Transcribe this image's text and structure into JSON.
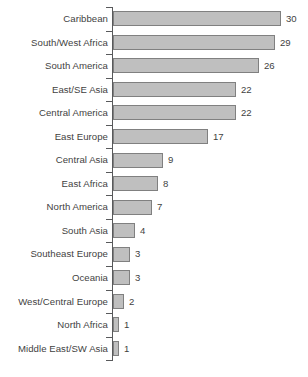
{
  "chart_data": {
    "type": "bar",
    "orientation": "horizontal",
    "title": "",
    "subtitle": "",
    "xlabel": "",
    "ylabel": "",
    "xlim": [
      0,
      30
    ],
    "grid": false,
    "legend": null,
    "bar_color": "#bfbfbf",
    "bar_border_color": "#808080",
    "axis_color": "#58595b",
    "text_color": "#3f3f3f",
    "background_color": "#ffffff",
    "show_value_labels": true,
    "categories": [
      "Caribbean",
      "South/West Africa",
      "South America",
      "East/SE Asia",
      "Central America",
      "East Europe",
      "Central Asia",
      "East Africa",
      "North America",
      "South Asia",
      "Southeast Europe",
      "Oceania",
      "West/Central Europe",
      "North Africa",
      "Middle East/SW Asia"
    ],
    "values": [
      30,
      29,
      26,
      22,
      22,
      17,
      9,
      8,
      7,
      4,
      3,
      3,
      2,
      1,
      1
    ]
  }
}
